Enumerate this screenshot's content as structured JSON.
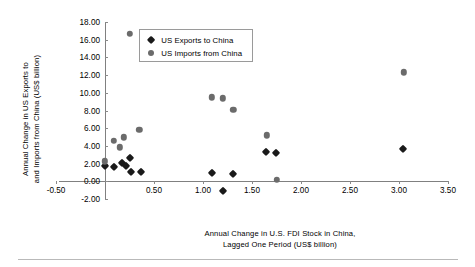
{
  "chart_data": {
    "type": "scatter",
    "title": "",
    "xlabel": "Annual Change in U.S. FDI Stock in China, Lagged One Period (US$ billion)",
    "ylabel": "Annual Change in US Exports to and Imports from China (US$ billion)",
    "xlim": [
      -0.5,
      3.5
    ],
    "ylim": [
      -2.0,
      18.0
    ],
    "grid": false,
    "legend_position": "top-left-inside",
    "xticks": [
      "-0.50",
      "0.50",
      "1.00",
      "1.50",
      "2.00",
      "2.50",
      "3.00",
      "3.50"
    ],
    "xtick_values": [
      -0.5,
      0.5,
      1.0,
      1.5,
      2.0,
      2.5,
      3.0,
      3.5
    ],
    "yticks": [
      "-2.00",
      "0.00",
      "2.00",
      "4.00",
      "6.00",
      "8.00",
      "10.00",
      "12.00",
      "14.00",
      "16.00",
      "18.00"
    ],
    "ytick_values": [
      -2.0,
      0.0,
      2.0,
      4.0,
      6.0,
      8.0,
      10.0,
      12.0,
      14.0,
      16.0,
      18.0
    ],
    "series": [
      {
        "name": "US Exports to China",
        "marker": "diamond",
        "color": "#1a1a1a",
        "points": [
          [
            0.0,
            1.75
          ],
          [
            0.09,
            1.6
          ],
          [
            0.17,
            2.05
          ],
          [
            0.21,
            1.75
          ],
          [
            0.25,
            2.65
          ],
          [
            0.27,
            1.1
          ],
          [
            0.37,
            1.0
          ],
          [
            1.09,
            0.9
          ],
          [
            1.2,
            -1.05
          ],
          [
            1.31,
            0.8
          ],
          [
            1.64,
            3.3
          ],
          [
            1.74,
            3.25
          ],
          [
            3.04,
            3.6
          ]
        ]
      },
      {
        "name": "US Imports from China",
        "marker": "circle",
        "color": "#6b6b6b",
        "points": [
          [
            0.0,
            2.25
          ],
          [
            0.09,
            4.6
          ],
          [
            0.15,
            3.85
          ],
          [
            0.19,
            4.95
          ],
          [
            0.25,
            16.65
          ],
          [
            0.35,
            5.8
          ],
          [
            1.09,
            9.5
          ],
          [
            1.2,
            9.4
          ],
          [
            1.31,
            8.05
          ],
          [
            1.65,
            5.2
          ],
          [
            1.75,
            0.2
          ],
          [
            3.05,
            12.3
          ]
        ]
      }
    ]
  },
  "axis": {
    "ylabel_line1": "Annual Change in US Exports to",
    "ylabel_line2": "and Imports from China (US$ billion)",
    "xlabel_line1": "Annual Change in U.S. FDI Stock in China,",
    "xlabel_line2": "Lagged One Period (US$ billion)"
  },
  "legend": {
    "entries": [
      {
        "label": "US Exports to China",
        "marker": "diamond-marker-icon"
      },
      {
        "label": "US Imports from China",
        "marker": "circle-marker-icon"
      }
    ]
  },
  "colors": {
    "exports": "#1a1a1a",
    "imports": "#6b6b6b",
    "axis": "#808080",
    "background": "#ffffff"
  }
}
